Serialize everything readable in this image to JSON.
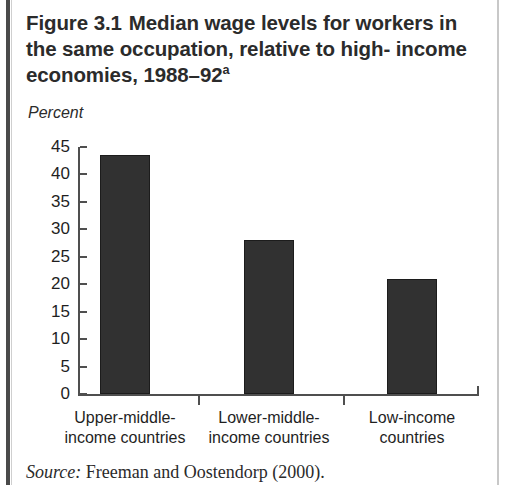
{
  "figure": {
    "title_line1_prefix": "Figure 3.1",
    "title_line1_rest": "Median wage levels for workers",
    "title_line2": "in the same occupation, relative to high-",
    "title_line3": "income economies, 1988–92",
    "title_superscript": "a",
    "source_label": "Source:",
    "source_text": "Freeman and Oostendorp (2000)."
  },
  "colors": {
    "bar_fill": "#313131",
    "bar_stroke": "#1c1c1c",
    "axis": "#4f4f4f",
    "text": "#1f1f1f",
    "title": "#2b2b2b"
  },
  "chart_data": {
    "type": "bar",
    "xlabel": "",
    "ylabel": "Percent",
    "categories": [
      "Upper-middle-income countries",
      "Lower-middle-income countries",
      "Low-income countries"
    ],
    "category_lines": [
      [
        "Upper-middle-",
        "income countries"
      ],
      [
        "Lower-middle-",
        "income countries"
      ],
      [
        "Low-income",
        "countries"
      ]
    ],
    "values": [
      43.5,
      28,
      21
    ],
    "ylim": [
      0,
      45
    ],
    "yticks": [
      0,
      5,
      10,
      15,
      20,
      25,
      30,
      35,
      40,
      45
    ],
    "ytick_labels": [
      "0",
      "5",
      "10",
      "15",
      "20",
      "25",
      "30",
      "35",
      "40",
      "45"
    ],
    "grid": false,
    "legend": "none"
  }
}
